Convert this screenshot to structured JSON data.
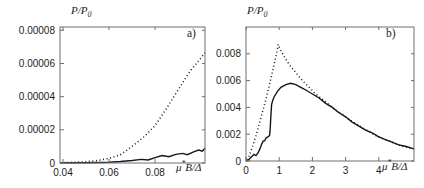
{
  "figure": {
    "background": "#ffffff",
    "curve_color": "#161616",
    "frame_color": "#6e6e6e",
    "text_color": "#1c1c1c"
  },
  "chart_data": [
    {
      "id": "panel-a",
      "type": "line",
      "panel_label": "a)",
      "ylabel_main": "P/P",
      "ylabel_sub": "0",
      "xlabel_mu": "μ",
      "xlabel_sup": "*",
      "xlabel_rest": "B/Δ",
      "xlim": [
        0.0387,
        0.1017
      ],
      "ylim": [
        0,
        8.2e-05
      ],
      "grid": false,
      "frame": true,
      "legend": "none",
      "xticks": [
        {
          "v": 0.04,
          "label": "0.04"
        },
        {
          "v": 0.06,
          "label": "0.06"
        },
        {
          "v": 0.08,
          "label": "0.08"
        }
      ],
      "yticks": [
        {
          "v": 0,
          "label": "0"
        },
        {
          "v": 2e-05,
          "label": "0.00002"
        },
        {
          "v": 4e-05,
          "label": "0.00004"
        },
        {
          "v": 6e-05,
          "label": "0.00006"
        },
        {
          "v": 8e-05,
          "label": "0.00008"
        }
      ],
      "series": [
        {
          "name": "dotted-curve",
          "style": "dotted",
          "points": [
            [
              0.0387,
              2e-07
            ],
            [
              0.045,
              4e-07
            ],
            [
              0.05,
              8e-07
            ],
            [
              0.055,
              1.5e-06
            ],
            [
              0.06,
              2.8e-06
            ],
            [
              0.065,
              5e-06
            ],
            [
              0.07,
              1e-05
            ],
            [
              0.075,
              1.55e-05
            ],
            [
              0.08,
              2.25e-05
            ],
            [
              0.085,
              3.3e-05
            ],
            [
              0.09,
              4.4e-05
            ],
            [
              0.095,
              5.5e-05
            ],
            [
              0.1,
              6.35e-05
            ],
            [
              0.1017,
              6.65e-05
            ]
          ]
        },
        {
          "name": "solid-curve",
          "style": "solid",
          "points": [
            [
              0.0387,
              1e-07
            ],
            [
              0.05,
              2e-07
            ],
            [
              0.06,
              5e-07
            ],
            [
              0.065,
              9e-07
            ],
            [
              0.07,
              1.5e-06
            ],
            [
              0.074,
              2.2e-06
            ],
            [
              0.077,
              1.8e-06
            ],
            [
              0.08,
              3.2e-06
            ],
            [
              0.083,
              4.5e-06
            ],
            [
              0.086,
              3.8e-06
            ],
            [
              0.089,
              5.2e-06
            ],
            [
              0.092,
              5.8e-06
            ],
            [
              0.094,
              5e-06
            ],
            [
              0.097,
              6.8e-06
            ],
            [
              0.099,
              7.8e-06
            ],
            [
              0.1005,
              7.2e-06
            ],
            [
              0.1017,
              8.8e-06
            ]
          ]
        }
      ]
    },
    {
      "id": "panel-b",
      "type": "line",
      "panel_label": "b)",
      "ylabel_main": "P/P",
      "ylabel_sub": "0",
      "xlabel_mu": "μ",
      "xlabel_sup": "*",
      "xlabel_rest": "B/Δ",
      "xlim": [
        0,
        5.06
      ],
      "ylim": [
        0,
        0.01
      ],
      "grid": false,
      "frame": true,
      "legend": "none",
      "xticks": [
        {
          "v": 0,
          "label": "0"
        },
        {
          "v": 1,
          "label": "1"
        },
        {
          "v": 2,
          "label": "2"
        },
        {
          "v": 3,
          "label": "3"
        },
        {
          "v": 4,
          "label": "4"
        }
      ],
      "yticks": [
        {
          "v": 0,
          "label": "0"
        },
        {
          "v": 0.002,
          "label": "0.002"
        },
        {
          "v": 0.004,
          "label": "0.004"
        },
        {
          "v": 0.006,
          "label": "0.006"
        },
        {
          "v": 0.008,
          "label": "0.008"
        }
      ],
      "series": [
        {
          "name": "dotted-curve",
          "style": "dotted",
          "points": [
            [
              0.02,
              0.0001
            ],
            [
              0.1,
              0.0004
            ],
            [
              0.2,
              0.0011
            ],
            [
              0.3,
              0.0019
            ],
            [
              0.4,
              0.0028
            ],
            [
              0.5,
              0.0037
            ],
            [
              0.6,
              0.0046
            ],
            [
              0.7,
              0.0056
            ],
            [
              0.8,
              0.0067
            ],
            [
              0.9,
              0.0078
            ],
            [
              0.97,
              0.0087
            ],
            [
              1.05,
              0.0082
            ],
            [
              1.15,
              0.0078
            ],
            [
              1.3,
              0.0072
            ],
            [
              1.5,
              0.0066
            ],
            [
              1.7,
              0.006
            ],
            [
              1.9,
              0.0055
            ],
            [
              2.1,
              0.005
            ],
            [
              2.3,
              0.0046
            ],
            [
              2.5,
              0.0042
            ],
            [
              2.7,
              0.0038
            ],
            [
              2.9,
              0.0035
            ],
            [
              3.1,
              0.0031
            ],
            [
              3.3,
              0.0028
            ],
            [
              3.5,
              0.0025
            ],
            [
              3.7,
              0.0022
            ],
            [
              3.9,
              0.0019
            ],
            [
              4.1,
              0.0017
            ],
            [
              4.3,
              0.0015
            ],
            [
              4.5,
              0.0013
            ],
            [
              4.7,
              0.0011
            ],
            [
              4.9,
              0.001
            ],
            [
              5.06,
              0.0009
            ]
          ]
        },
        {
          "name": "solid-curve",
          "style": "solid",
          "points": [
            [
              0,
              0
            ],
            [
              0.08,
              0.0001
            ],
            [
              0.16,
              0.0003
            ],
            [
              0.24,
              0.0005
            ],
            [
              0.3,
              0.0004
            ],
            [
              0.36,
              0.0006
            ],
            [
              0.42,
              0.0009
            ],
            [
              0.48,
              0.0013
            ],
            [
              0.52,
              0.0015
            ],
            [
              0.56,
              0.0015
            ],
            [
              0.6,
              0.0017
            ],
            [
              0.66,
              0.0018
            ],
            [
              0.71,
              0.0019
            ],
            [
              0.73,
              0.0024
            ],
            [
              0.75,
              0.0034
            ],
            [
              0.77,
              0.0042
            ],
            [
              0.8,
              0.0045
            ],
            [
              0.85,
              0.0048
            ],
            [
              0.95,
              0.0052
            ],
            [
              1.05,
              0.0055
            ],
            [
              1.2,
              0.0057
            ],
            [
              1.35,
              0.0058
            ],
            [
              1.5,
              0.0057
            ],
            [
              1.65,
              0.0055
            ],
            [
              1.8,
              0.0053
            ],
            [
              2.0,
              0.005
            ],
            [
              2.2,
              0.0047
            ],
            [
              2.4,
              0.0043
            ],
            [
              2.6,
              0.004
            ],
            [
              2.8,
              0.0036
            ],
            [
              3.0,
              0.0033
            ],
            [
              3.2,
              0.0029
            ],
            [
              3.4,
              0.0026
            ],
            [
              3.6,
              0.0023
            ],
            [
              3.8,
              0.0021
            ],
            [
              4.0,
              0.0018
            ],
            [
              4.2,
              0.0016
            ],
            [
              4.4,
              0.0014
            ],
            [
              4.6,
              0.0012
            ],
            [
              4.8,
              0.0011
            ],
            [
              5.06,
              0.0009
            ]
          ]
        }
      ]
    }
  ]
}
